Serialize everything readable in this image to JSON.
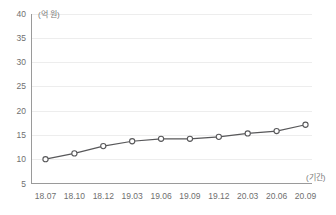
{
  "chart_data": {
    "type": "line",
    "title": "",
    "subtitle": "",
    "xlabel": "(기간)",
    "ylabel": "(억 원)",
    "categories": [
      "18.07",
      "18.10",
      "18.12",
      "19.03",
      "19.06",
      "19.09",
      "19.12",
      "20.03",
      "20.06",
      "20.09"
    ],
    "series": [
      {
        "name": "금액",
        "values": [
          10.0,
          11.2,
          12.7,
          13.7,
          14.2,
          14.2,
          14.6,
          15.3,
          15.8,
          17.1
        ]
      }
    ],
    "ylim": [
      5,
      40
    ],
    "yticks": [
      40,
      35,
      30,
      25,
      20,
      15,
      10,
      5
    ],
    "ytick_labels": [
      "40",
      "35",
      "30",
      "25",
      "20",
      "15",
      "10",
      "5"
    ],
    "grid": true,
    "grid_axis": "y",
    "legend": false,
    "legend_position": "none",
    "colors": {
      "line": "#58585a",
      "marker_fill": "#ffffff",
      "marker_stroke": "#58585a",
      "grid": "#ededed",
      "axis": "#9a9a9a",
      "tick_label": "#6f6f6f",
      "background": "#ffffff"
    }
  }
}
